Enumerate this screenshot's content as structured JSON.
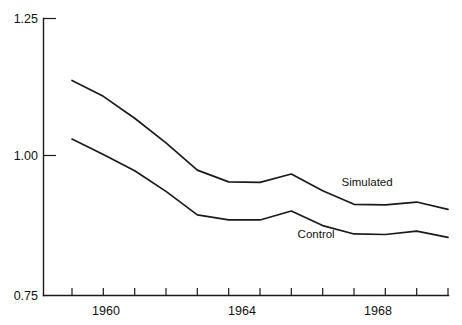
{
  "chart_data": {
    "type": "line",
    "title": "",
    "subtitle": "",
    "xlabel": "",
    "ylabel": "",
    "xlim": [
      1959,
      1971
    ],
    "ylim": [
      0.75,
      1.25
    ],
    "grid": false,
    "legend_position": "inline-labels",
    "y_ticks": [
      "1.25",
      "1.00",
      "0.75"
    ],
    "y_tick_values": [
      1.25,
      1.0,
      0.75
    ],
    "x_ticks": [
      "1960",
      "1964",
      "1968"
    ],
    "x_tick_values": [
      1960,
      1964,
      1968
    ],
    "x_all_tick_values": [
      1959,
      1960,
      1961,
      1962,
      1963,
      1964,
      1965,
      1966,
      1967,
      1968,
      1969,
      1970,
      1971
    ],
    "x": [
      1959,
      1960,
      1961,
      1962,
      1963,
      1964,
      1965,
      1966,
      1967,
      1968,
      1969,
      1970,
      1971
    ],
    "series": [
      {
        "name": "Simulated",
        "label": "Simulated",
        "color": "#1a1a1a",
        "values": [
          1.136,
          1.107,
          1.067,
          1.022,
          0.973,
          0.952,
          0.951,
          0.966,
          0.936,
          0.912,
          0.911,
          0.916,
          0.903
        ]
      },
      {
        "name": "Control",
        "label": "Control",
        "color": "#1a1a1a",
        "values": [
          1.029,
          1.001,
          0.972,
          0.935,
          0.893,
          0.884,
          0.884,
          0.9,
          0.874,
          0.859,
          0.858,
          0.864,
          0.853
        ]
      }
    ],
    "annotations": [
      {
        "text": "Simulated",
        "x": 1967.6,
        "y": 0.944
      },
      {
        "text": "Control",
        "x": 1966.2,
        "y": 0.851
      }
    ]
  }
}
